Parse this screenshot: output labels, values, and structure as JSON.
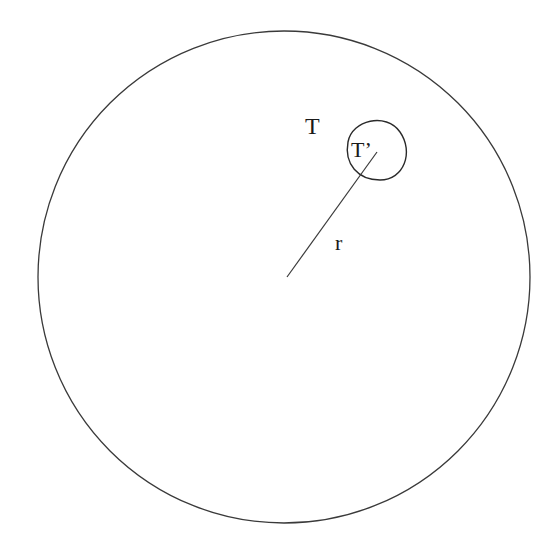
{
  "diagram": {
    "width": 551,
    "height": 548,
    "stroke_color": "#3a3a3a",
    "big_circle": {
      "cx": 284,
      "cy": 277,
      "r": 246,
      "label": "T"
    },
    "small_region": {
      "cx": 376,
      "cy": 150,
      "rx": 31,
      "ry": 30,
      "label": "T’"
    },
    "radius_line": {
      "x1": 287,
      "y1": 277,
      "x2": 377,
      "y2": 152,
      "label": "r"
    },
    "labels": {
      "T": {
        "text": "T",
        "x": 305,
        "y": 134,
        "size": 24
      },
      "T_prime": {
        "text": "T’",
        "x": 351,
        "y": 157,
        "size": 22
      },
      "r": {
        "text": "r",
        "x": 335,
        "y": 250,
        "size": 22
      }
    }
  }
}
